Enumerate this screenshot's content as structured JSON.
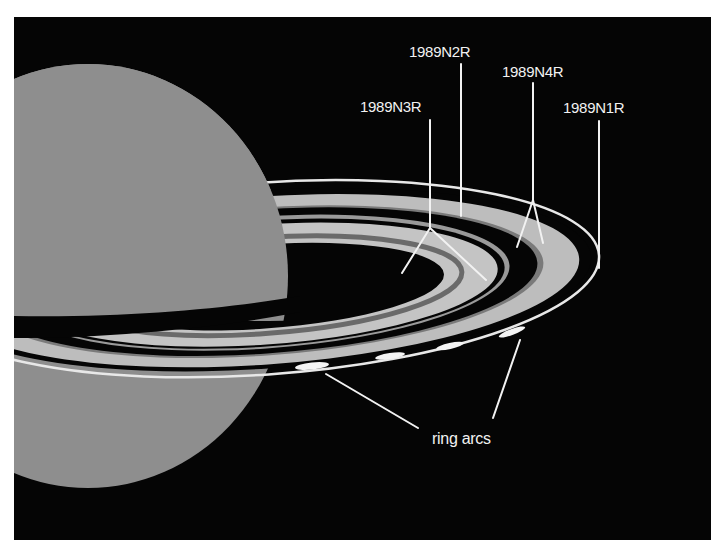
{
  "figure": {
    "background_color": "#050505",
    "planet_color": "#8e8e8e",
    "ring_colors": {
      "light": "#c4c4c4",
      "mid": "#9a9a9a",
      "dark_stripe": "#6a6a6a",
      "outer_ring": "#e8e8e8",
      "arcs": "#f4f4f4"
    }
  },
  "labels": {
    "n2r": "1989N2R",
    "n4r": "1989N4R",
    "n3r": "1989N3R",
    "n1r": "1989N1R",
    "ring_arcs": "ring arcs"
  }
}
